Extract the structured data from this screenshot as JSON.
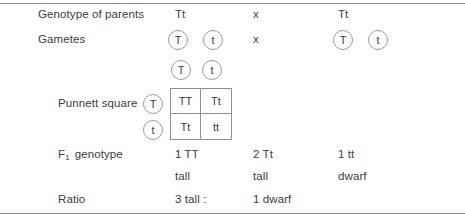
{
  "rows": {
    "parents": {
      "label": "Genotype of parents",
      "left": "Tt",
      "cross": "x",
      "right": "Tt"
    },
    "gametes": {
      "label": "Gametes",
      "left_alleles": [
        "T",
        "t"
      ],
      "cross": "x",
      "right_alleles": [
        "T",
        "t"
      ]
    },
    "punnett": {
      "label": "Punnett square",
      "column_headers": [
        "T",
        "t"
      ],
      "row_headers": [
        "T",
        "t"
      ],
      "cells": [
        [
          "TT",
          "Tt"
        ],
        [
          "Tt",
          "tt"
        ]
      ]
    },
    "f1_genotype": {
      "label_prefix": "F",
      "label_subscript": "1",
      "label_suffix": "genotype",
      "values": [
        "1 TT",
        "2 Tt",
        "1 tt"
      ],
      "phenotypes": [
        "tall",
        "tall",
        "dwarf"
      ]
    },
    "ratio": {
      "label": "Ratio",
      "left": "3 tall :",
      "right": "1 dwarf"
    }
  }
}
